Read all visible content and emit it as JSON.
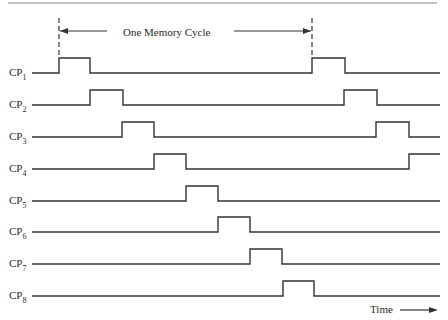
{
  "diagram": {
    "title_annotation": "One Memory Cycle",
    "time_label": "Time",
    "colors": {
      "line": "#333333",
      "rule": "#888888",
      "text": "#2a2a2a"
    },
    "cycle_markers_x": [
      59,
      312
    ],
    "signals": [
      {
        "name": "CP",
        "sub": "1",
        "base_y": 73,
        "pulses": [
          [
            59,
            90
          ],
          [
            312,
            345
          ]
        ]
      },
      {
        "name": "CP",
        "sub": "2",
        "base_y": 105,
        "pulses": [
          [
            90,
            123
          ],
          [
            344,
            377
          ]
        ]
      },
      {
        "name": "CP",
        "sub": "3",
        "base_y": 137,
        "pulses": [
          [
            122,
            154
          ],
          [
            376,
            409
          ]
        ]
      },
      {
        "name": "CP",
        "sub": "4",
        "base_y": 169,
        "pulses": [
          [
            154,
            186
          ],
          [
            409,
            440
          ]
        ]
      },
      {
        "name": "CP",
        "sub": "5",
        "base_y": 201,
        "pulses": [
          [
            186,
            218
          ]
        ]
      },
      {
        "name": "CP",
        "sub": "6",
        "base_y": 232,
        "pulses": [
          [
            218,
            250
          ]
        ]
      },
      {
        "name": "CP",
        "sub": "7",
        "base_y": 264,
        "pulses": [
          [
            250,
            282
          ]
        ]
      },
      {
        "name": "CP",
        "sub": "8",
        "base_y": 296,
        "pulses": [
          [
            283,
            314
          ]
        ]
      }
    ]
  }
}
